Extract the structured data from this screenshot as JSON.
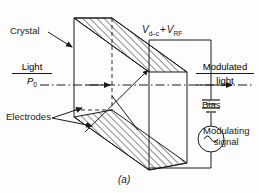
{
  "figure": {
    "caption": "(a)",
    "background_color": "#fdfdfd",
    "ink_color": "#1a1a1a",
    "hatch_color": "#2a2a2a"
  },
  "labels": {
    "crystal": "Crystal",
    "electrodes": "Electrodes",
    "bias": "Bias",
    "voltage": {
      "v1_symbol": "V",
      "v1_subscript": "d–c",
      "operator": "+",
      "v2_symbol": "V",
      "v2_subscript": "RF",
      "full": "Vd–c + VRF"
    },
    "input_light": {
      "numerator": "Light",
      "denominator": "P",
      "denominator_subscript": "0"
    },
    "output_light": {
      "numerator": "Modulated",
      "denominator": "light"
    },
    "modulating_signal": {
      "line1": "Modulating",
      "line2": "signal"
    }
  },
  "icons": {
    "ac_source": "ac-source-icon",
    "battery": "battery-icon",
    "crystal_arrow": "arrow-pointer-icon",
    "electrodes_arrow": "double-arrow-pointer-icon",
    "beam_arrow": "light-beam-arrow-icon"
  }
}
